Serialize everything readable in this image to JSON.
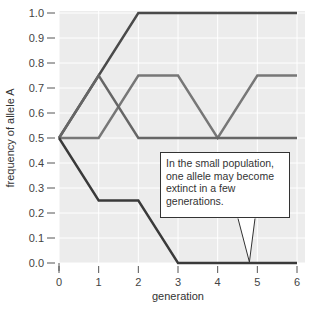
{
  "chart_data": {
    "type": "line",
    "title": "",
    "xlabel": "generation",
    "ylabel": "frequency of allele A",
    "x": [
      0,
      1,
      2,
      3,
      4,
      5,
      6
    ],
    "xticks": [
      "0",
      "1",
      "2",
      "3",
      "4",
      "5",
      "6"
    ],
    "yticks": [
      "0.0",
      "0.1",
      "0.2",
      "0.3",
      "0.4",
      "0.5",
      "0.6",
      "0.7",
      "0.8",
      "0.9",
      "1.0"
    ],
    "xlim": [
      0,
      6
    ],
    "ylim": [
      0,
      1.0
    ],
    "grid": true,
    "legend": null,
    "series": [
      {
        "name": "population 1",
        "color": "#4a4a4a",
        "values": [
          0.5,
          0.75,
          1.0,
          1.0,
          1.0,
          1.0,
          1.0
        ]
      },
      {
        "name": "population 2",
        "color": "#777777",
        "values": [
          0.5,
          0.5,
          0.75,
          0.75,
          0.5,
          0.75,
          0.75
        ]
      },
      {
        "name": "population 3",
        "color": "#666666",
        "values": [
          0.5,
          0.75,
          0.5,
          0.5,
          0.5,
          0.5,
          0.5
        ]
      },
      {
        "name": "population 4",
        "color": "#3a3a3a",
        "values": [
          0.5,
          0.25,
          0.25,
          0.0,
          0.0,
          0.0,
          0.0
        ]
      }
    ],
    "annotations": [
      {
        "text": "In the small population, one allele may become extinct in a few generations.",
        "points_to": {
          "x": 4.8,
          "y": 0.0
        }
      }
    ]
  },
  "callout": {
    "text": "In the small population, one allele may become extinct in a few generations."
  },
  "axes": {
    "xlabel": "generation",
    "ylabel": "frequency of allele A"
  }
}
